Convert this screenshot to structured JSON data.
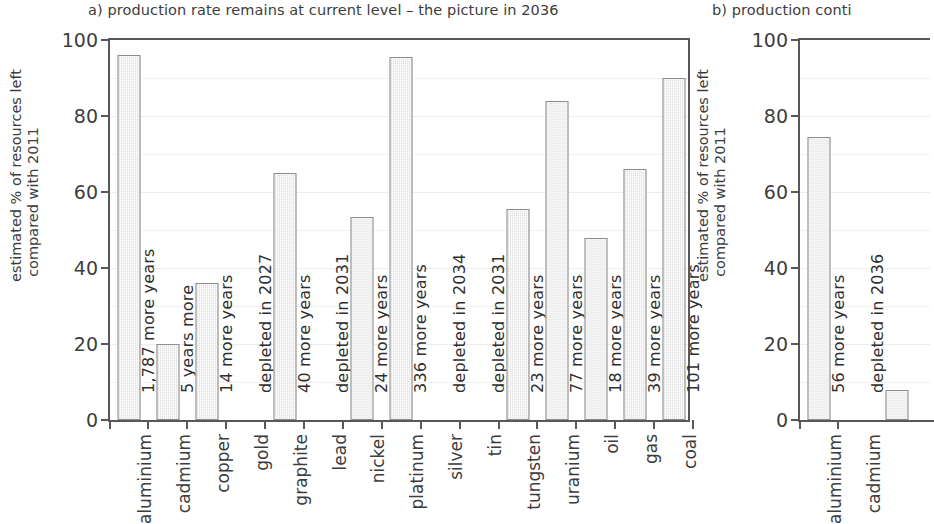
{
  "figure": {
    "panels": [
      {
        "id": "a",
        "title": "a) production rate remains at current level – the picture in 2036",
        "ylabel_line1": "estimated % of resources left",
        "ylabel_line2": "compared with 2011"
      },
      {
        "id": "b",
        "title": "b) production conti",
        "ylabel_line1": "estimated % of resources left",
        "ylabel_line2": "compared with 2011"
      }
    ]
  },
  "chart_data": [
    {
      "type": "bar",
      "panel": "a",
      "title": "a) production rate remains at current level – the picture in 2036",
      "xlabel": "",
      "ylabel": "estimated % of resources left compared with 2011",
      "ylim": [
        0,
        100
      ],
      "yticks": [
        0,
        20,
        40,
        60,
        80,
        100
      ],
      "grid": true,
      "legend": "none",
      "categories": [
        "aluminium",
        "cadmium",
        "copper",
        "gold",
        "graphite",
        "lead",
        "nickel",
        "platinum",
        "silver",
        "tin",
        "tungsten",
        "uranium",
        "oil",
        "gas",
        "coal"
      ],
      "values": [
        96,
        20,
        36,
        0,
        65,
        0,
        53.5,
        95.5,
        0,
        0,
        55.5,
        84,
        48,
        66,
        90
      ],
      "annotations": [
        "1,787 more years",
        "5 years more",
        "14 more years",
        "depleted in 2027",
        "40 more years",
        "depleted in 2031",
        "24 more years",
        "336 more years",
        "depleted in 2034",
        "depleted in 2031",
        "23 more years",
        "77 more years",
        "18 more years",
        "39 more years",
        "101 more years"
      ]
    },
    {
      "type": "bar",
      "panel": "b",
      "title": "b) production conti",
      "xlabel": "",
      "ylabel": "estimated % of resources left compared with 2011",
      "ylim": [
        0,
        100
      ],
      "yticks": [
        0,
        20,
        40,
        60,
        80,
        100
      ],
      "grid": true,
      "legend": "none",
      "categories": [
        "aluminium",
        "cadmium",
        ""
      ],
      "values": [
        74.5,
        0,
        8
      ],
      "annotations": [
        "56 more years",
        "depleted in 2036",
        ""
      ]
    }
  ]
}
